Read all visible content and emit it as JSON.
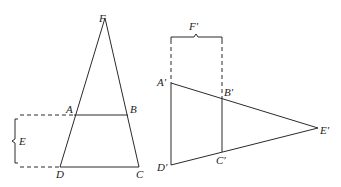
{
  "figure": {
    "left": {
      "name": "trapezoid-in-triangle",
      "points": {
        "F": [
          105,
          18
        ],
        "A": [
          74,
          115
        ],
        "B": [
          128,
          115
        ],
        "D": [
          60,
          167
        ],
        "C": [
          139,
          167
        ]
      },
      "labels": {
        "F": "F",
        "A": "A",
        "B": "B",
        "C": "C",
        "D": "D",
        "E": "E"
      }
    },
    "right": {
      "name": "rotated-trapezoid",
      "points": {
        "A_prime": [
          171,
          83
        ],
        "B_prime": [
          222,
          103
        ],
        "C_prime": [
          222,
          152
        ],
        "D_prime": [
          171,
          165
        ],
        "E_prime": [
          318,
          128
        ]
      },
      "labels": {
        "A_prime": "A′",
        "B_prime": "B′",
        "C_prime": "C′",
        "D_prime": "D′",
        "E_prime": "E′",
        "F_prime": "F′"
      }
    },
    "stroke_color": "#2a2a2a"
  }
}
